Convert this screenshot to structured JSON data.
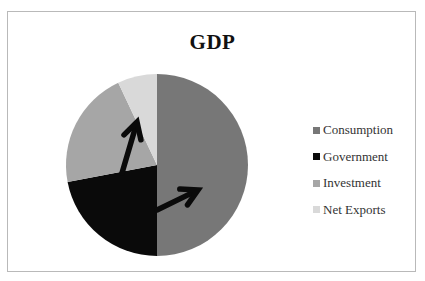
{
  "chart_data": {
    "type": "pie",
    "title": "GDP",
    "categories": [
      "Consumption",
      "Government",
      "Investment",
      "Net Exports"
    ],
    "values": [
      50,
      22,
      21,
      7
    ],
    "unit": "percent (estimated)",
    "colors": [
      "#777777",
      "#0a0a0a",
      "#a6a6a6",
      "#d9d9d9"
    ],
    "start_angle_deg": 0,
    "direction": "clockwise",
    "legend": {
      "position": "right",
      "entries": [
        "Consumption",
        "Government",
        "Investment",
        "Net Exports"
      ]
    },
    "annotations": [
      {
        "type": "arrow",
        "from": [
          157,
          210
        ],
        "to": [
          198,
          190
        ],
        "within": "Consumption",
        "meaning": "increase"
      },
      {
        "type": "arrow",
        "from": [
          122,
          173
        ],
        "to": [
          137,
          122
        ],
        "within": "Investment",
        "meaning": "increase"
      }
    ]
  },
  "pie": {
    "cx": 157,
    "cy": 165,
    "r": 91
  },
  "legend": {
    "items": [
      {
        "label": "Consumption",
        "color": "#777777"
      },
      {
        "label": "Government",
        "color": "#0a0a0a"
      },
      {
        "label": "Investment",
        "color": "#a6a6a6"
      },
      {
        "label": "Net Exports",
        "color": "#d9d9d9"
      }
    ]
  }
}
